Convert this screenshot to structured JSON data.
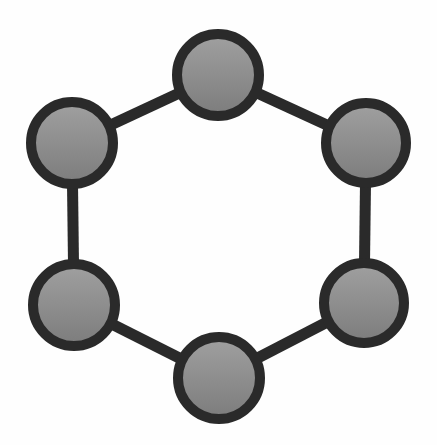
{
  "figure": {
    "kind": "node-link-diagram",
    "name": "hexagonal-ring-graph",
    "title": "",
    "caption": "",
    "width": 437,
    "height": 445,
    "background_color": "#fefefe",
    "has_labels": false,
    "has_legend": false,
    "has_axes": false
  },
  "chart_data": {
    "type": "diagram",
    "graph_type": "cycle-graph",
    "title": "",
    "node_count": 6,
    "edge_count": 6,
    "degree_per_node": 2,
    "layout": "hexagonal-ring",
    "nodes": [
      {
        "id": "n1",
        "label": "",
        "position": "top",
        "cx": 218,
        "cy": 75,
        "r": 46
      },
      {
        "id": "n2",
        "label": "",
        "position": "upper-right",
        "cx": 366,
        "cy": 143,
        "r": 45
      },
      {
        "id": "n3",
        "label": "",
        "position": "lower-right",
        "cx": 364,
        "cy": 303,
        "r": 45
      },
      {
        "id": "n4",
        "label": "",
        "position": "bottom",
        "cx": 219,
        "cy": 378,
        "r": 46
      },
      {
        "id": "n5",
        "label": "",
        "position": "lower-left",
        "cx": 74,
        "cy": 305,
        "r": 46
      },
      {
        "id": "n6",
        "label": "",
        "position": "upper-left",
        "cx": 72,
        "cy": 143,
        "r": 46
      }
    ],
    "edges": [
      {
        "id": "e1",
        "source": "n6",
        "target": "n1",
        "orientation": "diagonal"
      },
      {
        "id": "e2",
        "source": "n1",
        "target": "n2",
        "orientation": "diagonal"
      },
      {
        "id": "e3",
        "source": "n2",
        "target": "n3",
        "orientation": "vertical"
      },
      {
        "id": "e4",
        "source": "n3",
        "target": "n4",
        "orientation": "diagonal"
      },
      {
        "id": "e5",
        "source": "n4",
        "target": "n5",
        "orientation": "diagonal"
      },
      {
        "id": "e6",
        "source": "n5",
        "target": "n6",
        "orientation": "vertical"
      }
    ]
  },
  "style": {
    "node_border_color": "#2a2a2a",
    "node_border_width": 10,
    "node_fill_gradient_start": "#a0a0a0",
    "node_fill_gradient_end": "#7c7c7c",
    "node_fill_gradient_direction": "top-to-bottom",
    "edge_color": "#2a2a2a",
    "edge_width": 11,
    "background_color": "#fefefe"
  }
}
